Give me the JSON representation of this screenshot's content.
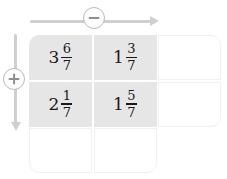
{
  "operators": {
    "horizontal": {
      "symbol": "−",
      "icon": "circled-minus-icon",
      "direction": "right",
      "label": "minus"
    },
    "vertical": {
      "symbol": "+",
      "icon": "circled-plus-icon",
      "direction": "down",
      "label": "plus"
    }
  },
  "colors": {
    "filled_cell": "#e6e6e6",
    "empty_cell": "#ffffff",
    "axis": "#cfcfcf",
    "text": "#1a1a1a",
    "cell_border": "#f0f0f0"
  },
  "grid": {
    "rows": 3,
    "columns": 3,
    "cells": [
      [
        {
          "filled": true,
          "whole": "3",
          "numerator": "6",
          "denominator": "7"
        },
        {
          "filled": true,
          "whole": "1",
          "numerator": "3",
          "denominator": "7"
        },
        {
          "filled": false,
          "whole": "",
          "numerator": "",
          "denominator": ""
        }
      ],
      [
        {
          "filled": true,
          "whole": "2",
          "numerator": "1",
          "denominator": "7"
        },
        {
          "filled": true,
          "whole": "1",
          "numerator": "5",
          "denominator": "7"
        },
        {
          "filled": false,
          "whole": "",
          "numerator": "",
          "denominator": ""
        }
      ],
      [
        {
          "filled": false,
          "whole": "",
          "numerator": "",
          "denominator": ""
        },
        {
          "filled": false,
          "whole": "",
          "numerator": "",
          "denominator": ""
        },
        {
          "filled": false,
          "whole": "",
          "numerator": "",
          "denominator": ""
        }
      ]
    ]
  }
}
